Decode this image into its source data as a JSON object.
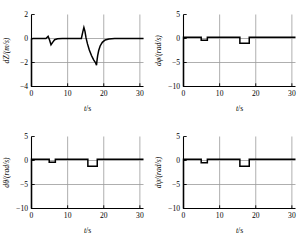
{
  "figure": {
    "layout": "2x2 grid of line plots",
    "background": "#ffffff",
    "line_color": "#000000",
    "grid_color": "#9a9a9a"
  },
  "chart_data": [
    {
      "id": "panel-dz",
      "type": "line",
      "title": "",
      "xlabel": "t/s",
      "ylabel": "dZ/(m/s)",
      "xlim": [
        0,
        31
      ],
      "ylim": [
        -4,
        2
      ],
      "xticks": [
        0,
        10,
        20,
        30
      ],
      "xticklabels": [
        "0",
        "10",
        "20",
        "30"
      ],
      "yticks": [
        2,
        0,
        -2,
        -4
      ],
      "yticklabels": [
        "2",
        "0",
        "-2",
        "-4"
      ],
      "grid": true,
      "series": [
        {
          "name": "dZ",
          "x": [
            0,
            0,
            0.4,
            4.0,
            4.6,
            5.0,
            5.4,
            5.9,
            6.4,
            7.2,
            8.5,
            13.8,
            14.2,
            14.5,
            14.8,
            15.1,
            15.5,
            16.0,
            16.6,
            17.2,
            17.7,
            18.0,
            18.1,
            18.3,
            18.6,
            19.0,
            19.6,
            20.4,
            21.4,
            23.0,
            31.0
          ],
          "y": [
            -4.0,
            -0.05,
            0.0,
            0.0,
            0.18,
            -0.12,
            -0.52,
            -0.3,
            -0.1,
            -0.02,
            0.0,
            0.0,
            0.55,
            0.92,
            0.6,
            0.05,
            -0.45,
            -0.95,
            -1.42,
            -1.78,
            -2.0,
            -2.22,
            -1.9,
            -1.45,
            -1.0,
            -0.62,
            -0.32,
            -0.12,
            -0.04,
            0.0,
            0.0
          ]
        }
      ]
    },
    {
      "id": "panel-dphi",
      "type": "line",
      "title": "",
      "xlabel": "t/s",
      "ylabel": "dφ/(rad/s)",
      "xlim": [
        0,
        31
      ],
      "ylim": [
        -10,
        5
      ],
      "xticks": [
        0,
        10,
        20,
        30
      ],
      "xticklabels": [
        "0",
        "10",
        "20",
        "30"
      ],
      "yticks": [
        5,
        0,
        -5,
        -10
      ],
      "yticklabels": [
        "5",
        "0",
        "-5",
        "-10"
      ],
      "grid": true,
      "series": [
        {
          "name": "dphi",
          "x": [
            0,
            0,
            4.9,
            4.9,
            6.6,
            6.6,
            15.6,
            15.6,
            18.2,
            18.2,
            31.0
          ],
          "y": [
            -10.0,
            0.25,
            0.25,
            -0.35,
            -0.35,
            0.25,
            0.25,
            -1.0,
            -1.0,
            0.25,
            0.25
          ]
        }
      ]
    },
    {
      "id": "panel-dtheta",
      "type": "line",
      "title": "",
      "xlabel": "t/s",
      "ylabel": "dθ/(rad/s)",
      "xlim": [
        0,
        31
      ],
      "ylim": [
        -10,
        5
      ],
      "xticks": [
        0,
        10,
        20,
        30
      ],
      "xticklabels": [
        "0",
        "10",
        "20",
        "30"
      ],
      "yticks": [
        5,
        0,
        -5,
        -10
      ],
      "yticklabels": [
        "5",
        "0",
        "-5",
        "-10"
      ],
      "grid": true,
      "series": [
        {
          "name": "dtheta",
          "x": [
            0,
            0,
            4.9,
            4.9,
            6.6,
            6.6,
            15.6,
            15.6,
            18.2,
            18.2,
            31.0
          ],
          "y": [
            -10.0,
            0.25,
            0.25,
            -0.35,
            -0.35,
            0.25,
            0.25,
            -1.2,
            -1.2,
            0.25,
            0.25
          ]
        }
      ]
    },
    {
      "id": "panel-dpsi",
      "type": "line",
      "title": "",
      "xlabel": "t/s",
      "ylabel": "dψ/(rad/s)",
      "xlim": [
        0,
        31
      ],
      "ylim": [
        -10,
        5
      ],
      "xticks": [
        0,
        10,
        20,
        30
      ],
      "xticklabels": [
        "0",
        "10",
        "20",
        "30"
      ],
      "yticks": [
        5,
        0,
        -5,
        -10
      ],
      "yticklabels": [
        "5",
        "0",
        "-5",
        "-10"
      ],
      "grid": true,
      "series": [
        {
          "name": "dpsi",
          "x": [
            0,
            0,
            4.9,
            4.9,
            6.6,
            6.6,
            15.6,
            15.6,
            18.2,
            18.2,
            31.0
          ],
          "y": [
            -10.0,
            0.25,
            0.25,
            -0.45,
            -0.45,
            0.25,
            0.25,
            -1.2,
            -1.2,
            0.25,
            0.25
          ]
        }
      ]
    }
  ]
}
